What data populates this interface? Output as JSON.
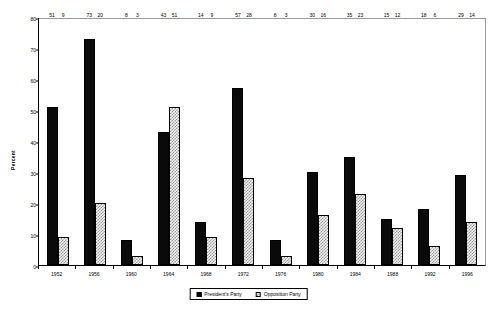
{
  "chart_data": {
    "type": "bar",
    "title": "",
    "xlabel": "",
    "ylabel": "Percent",
    "ylim": [
      0,
      80
    ],
    "y_ticks": [
      0,
      10,
      20,
      30,
      40,
      50,
      60,
      70,
      80
    ],
    "grid": false,
    "legend_position": "bottom-center",
    "categories": [
      "1952",
      "1956",
      "1960",
      "1964",
      "1968",
      "1972",
      "1976",
      "1980",
      "1984",
      "1988",
      "1992",
      "1996"
    ],
    "series": [
      {
        "name": "President's Party",
        "color": "#000000",
        "pattern": "solid",
        "values": [
          51,
          73,
          8,
          43,
          14,
          57,
          8,
          30,
          35,
          15,
          18,
          29
        ]
      },
      {
        "name": "Opposition Party",
        "color": "#cccccc",
        "pattern": "checkered",
        "values": [
          9,
          20,
          3,
          51,
          9,
          28,
          3,
          16,
          23,
          12,
          6,
          14
        ]
      }
    ]
  },
  "legend": {
    "items": [
      {
        "label": "President's Party"
      },
      {
        "label": "Opposition Party"
      }
    ]
  }
}
